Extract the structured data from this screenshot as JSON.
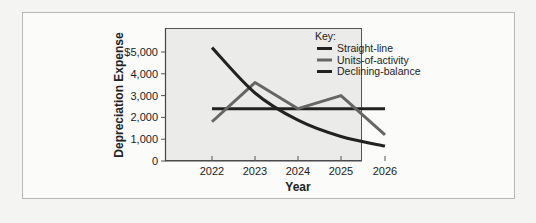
{
  "chart_data": {
    "type": "line",
    "title": "",
    "xlabel": "Year",
    "ylabel": "Depreciation Expense",
    "categories": [
      "2022",
      "2023",
      "2024",
      "2025",
      "2026"
    ],
    "y_ticks": [
      "0",
      "1,000",
      "2,000",
      "3,000",
      "4,000",
      "$5,000"
    ],
    "ylim": [
      0,
      5500
    ],
    "grid": false,
    "legend": {
      "title": "Key:",
      "position": "top-right-inside",
      "entries": [
        "Straight-line",
        "Units-of-activity",
        "Declining-balance"
      ]
    },
    "series": [
      {
        "name": "Straight-line",
        "color": "#222222",
        "values": [
          2400,
          2400,
          2400,
          2400,
          2400
        ]
      },
      {
        "name": "Units-of-activity",
        "color": "#666666",
        "values": [
          1800,
          3600,
          2400,
          3000,
          1200
        ]
      },
      {
        "name": "Declining-balance",
        "color": "#222222",
        "values": [
          5200,
          3120,
          1872,
          1123,
          685
        ]
      }
    ]
  }
}
